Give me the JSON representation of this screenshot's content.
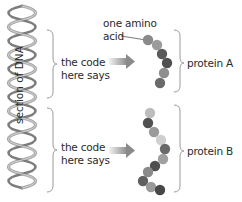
{
  "diagram": {
    "dna": {
      "label": "section of DNA",
      "color": "#9a9a9a"
    },
    "upper": {
      "code_label_line1": "the code",
      "code_label_line2": "here says",
      "protein_label": "protein A",
      "beads": [
        {
          "x": 148,
          "y": 40,
          "color": "#8a8a8a"
        },
        {
          "x": 157,
          "y": 45,
          "color": "#9b9b9b"
        },
        {
          "x": 162,
          "y": 54,
          "color": "#5a5a5a"
        },
        {
          "x": 167,
          "y": 63,
          "color": "#505050"
        },
        {
          "x": 164,
          "y": 73,
          "color": "#8e8e8e"
        },
        {
          "x": 160,
          "y": 83,
          "color": "#6b6b6b"
        }
      ]
    },
    "lower": {
      "code_label_line1": "the code",
      "code_label_line2": "here says",
      "protein_label": "protein B",
      "beads": [
        {
          "x": 150,
          "y": 113,
          "color": "#bdbdbd"
        },
        {
          "x": 148,
          "y": 123,
          "color": "#505050"
        },
        {
          "x": 154,
          "y": 132,
          "color": "#9a9a9a"
        },
        {
          "x": 161,
          "y": 140,
          "color": "#cfcfcf"
        },
        {
          "x": 165,
          "y": 149,
          "color": "#6a6a6a"
        },
        {
          "x": 163,
          "y": 159,
          "color": "#a0a0a0"
        },
        {
          "x": 155,
          "y": 166,
          "color": "#4e4e4e"
        },
        {
          "x": 148,
          "y": 172,
          "color": "#8a8a8a"
        },
        {
          "x": 143,
          "y": 181,
          "color": "#606060"
        },
        {
          "x": 151,
          "y": 187,
          "color": "#9a9a9a"
        },
        {
          "x": 160,
          "y": 190,
          "color": "#474747"
        }
      ]
    },
    "amino_acid_label_line1": "one amino",
    "amino_acid_label_line2": "acid",
    "colors": {
      "bracket": "#9a9a9a",
      "text": "#2a2a2a",
      "arrow_dark": "#8a8a8a",
      "arrow_light": "#e8e8e8"
    }
  }
}
